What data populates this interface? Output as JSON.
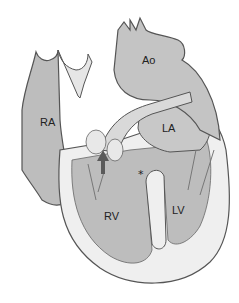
{
  "diagram": {
    "type": "anatomical-illustration",
    "labels": {
      "ra": "RA",
      "ao": "Ao",
      "la": "LA",
      "rv": "RV",
      "lv": "LV",
      "asterisk": "*"
    },
    "annotations": [
      {
        "symbol": "arrow-up",
        "color": "#5a5a5a",
        "points_to": "septal region below aorta"
      },
      {
        "symbol": "*",
        "location": "between RV and LV, upper septum"
      }
    ],
    "colors": {
      "chamber_fill": "#bdbdbd",
      "wall": "#efefef",
      "outline": "#555555",
      "arrow": "#5a5a5a",
      "background": "#ffffff"
    }
  }
}
